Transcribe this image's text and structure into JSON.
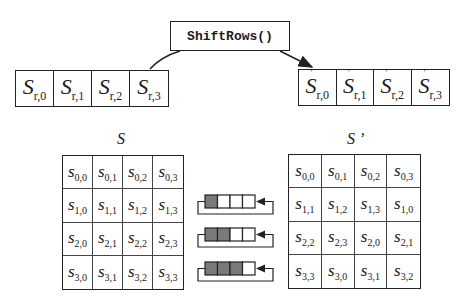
{
  "function_box": {
    "label": "ShiftRows()"
  },
  "input_row": {
    "cells": [
      {
        "base": "S",
        "sub": "r,0"
      },
      {
        "base": "S",
        "sub": "r,1"
      },
      {
        "base": "S",
        "sub": "r,2"
      },
      {
        "base": "S",
        "sub": "r,3"
      }
    ]
  },
  "output_row": {
    "prime": "'",
    "cells": [
      {
        "base": "S",
        "sub": "r,0"
      },
      {
        "base": "S",
        "sub": "r,1"
      },
      {
        "base": "S",
        "sub": "r,2"
      },
      {
        "base": "S",
        "sub": "r,3"
      }
    ]
  },
  "state_before": {
    "label": "S",
    "cells": [
      [
        "0,0",
        "0,1",
        "0,2",
        "0,3"
      ],
      [
        "1,0",
        "1,1",
        "1,2",
        "1,3"
      ],
      [
        "2,0",
        "2,1",
        "2,2",
        "2,3"
      ],
      [
        "3,0",
        "3,1",
        "3,2",
        "3,3"
      ]
    ],
    "base": "s"
  },
  "state_after": {
    "label": "S ’",
    "cells": [
      [
        "0,0",
        "0,1",
        "0,2",
        "0,3"
      ],
      [
        "1,1",
        "1,2",
        "1,3",
        "1,0"
      ],
      [
        "2,2",
        "2,3",
        "2,0",
        "2,1"
      ],
      [
        "3,3",
        "3,0",
        "3,1",
        "3,2"
      ]
    ],
    "base": "s"
  },
  "shift_diagrams": [
    {
      "row": 1,
      "shaded": 1
    },
    {
      "row": 2,
      "shaded": 2
    },
    {
      "row": 3,
      "shaded": 3
    }
  ],
  "colors": {
    "shaded": "#7a7a7a",
    "line": "#222222"
  }
}
